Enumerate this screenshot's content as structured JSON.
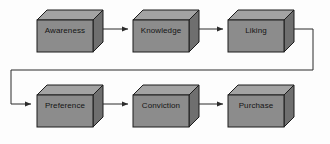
{
  "diagram": {
    "type": "flowchart",
    "background_color": "#fdfdfd",
    "box_style": {
      "front_fill": "#8c8c8c",
      "top_fill": "#a3a3a3",
      "side_fill": "#6f6f6f",
      "stroke": "#1c1c1c",
      "text_color": "#141414"
    },
    "connector_color": "#2b2b2b",
    "nodes": [
      {
        "id": "awareness",
        "label": "Awareness",
        "row": 1,
        "col": 1,
        "x": 37,
        "y": 10
      },
      {
        "id": "knowledge",
        "label": "Knowledge",
        "row": 1,
        "col": 2,
        "x": 133,
        "y": 10
      },
      {
        "id": "liking",
        "label": "Liking",
        "row": 1,
        "col": 3,
        "x": 228,
        "y": 10
      },
      {
        "id": "preference",
        "label": "Preference",
        "row": 2,
        "col": 1,
        "x": 37,
        "y": 85
      },
      {
        "id": "conviction",
        "label": "Conviction",
        "row": 2,
        "col": 2,
        "x": 133,
        "y": 85
      },
      {
        "id": "purchase",
        "label": "Purchase",
        "row": 2,
        "col": 3,
        "x": 228,
        "y": 85
      }
    ],
    "connectors": [
      {
        "id": "awareness-to-knowledge",
        "from": "awareness",
        "to": "knowledge",
        "kind": "straight"
      },
      {
        "id": "knowledge-to-liking",
        "from": "knowledge",
        "to": "liking",
        "kind": "straight"
      },
      {
        "id": "liking-to-preference",
        "from": "liking",
        "to": "preference",
        "kind": "elbow-wrap"
      },
      {
        "id": "preference-to-conviction",
        "from": "preference",
        "to": "conviction",
        "kind": "straight"
      },
      {
        "id": "conviction-to-purchase",
        "from": "conviction",
        "to": "purchase",
        "kind": "straight"
      }
    ]
  }
}
